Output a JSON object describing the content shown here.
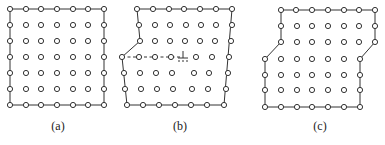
{
  "figure": {
    "panels": [
      {
        "id": "a",
        "label": "(a)",
        "description": "Perfect square lattice 7x7 with bounding outline"
      },
      {
        "id": "b",
        "label": "(b)",
        "description": "Lattice with edge dislocation; extra half-plane shown dashed, dislocation symbol ⊥"
      },
      {
        "id": "c",
        "label": "(c)",
        "description": "Lattice with kinked boundary steps on both sides"
      }
    ],
    "dislocation_symbol": "⊥",
    "colors": {
      "line": "#333333",
      "atom_stroke": "#333333",
      "atom_fill": "#ffffff",
      "background": "#ffffff"
    }
  }
}
